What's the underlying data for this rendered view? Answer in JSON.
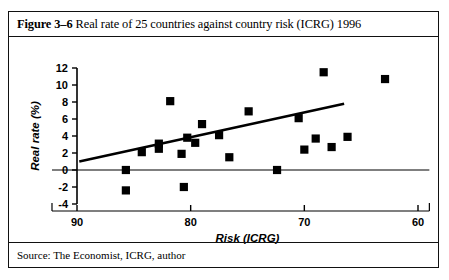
{
  "figure": {
    "label": "Figure 3–6",
    "title": "Real rate of 25 countries against country risk (ICRG) 1996",
    "source": "Source: The Economist, ICRG, author"
  },
  "chart_data": {
    "type": "scatter",
    "title": "Real rate of 25 countries against country risk (ICRG) 1996",
    "xlabel": "Risk (ICRG)",
    "ylabel": "Real rate (%)",
    "xlim": [
      92,
      59
    ],
    "ylim": [
      -4,
      12
    ],
    "x_reversed": true,
    "xticks": [
      90,
      80,
      70,
      60
    ],
    "yticks": [
      -4,
      -2,
      0,
      2,
      4,
      6,
      8,
      10,
      12
    ],
    "grid": false,
    "legend": "none",
    "marker": "filled-square",
    "marker_color": "#000000",
    "points": [
      {
        "x": 85.7,
        "y": 0.0
      },
      {
        "x": 85.7,
        "y": -2.4
      },
      {
        "x": 84.3,
        "y": 2.1
      },
      {
        "x": 82.8,
        "y": 3.1
      },
      {
        "x": 82.8,
        "y": 2.5
      },
      {
        "x": 81.8,
        "y": 8.1
      },
      {
        "x": 80.8,
        "y": 1.9
      },
      {
        "x": 80.6,
        "y": -2.0
      },
      {
        "x": 80.3,
        "y": 3.8
      },
      {
        "x": 79.6,
        "y": 3.2
      },
      {
        "x": 79.0,
        "y": 5.4
      },
      {
        "x": 77.5,
        "y": 4.1
      },
      {
        "x": 76.6,
        "y": 1.5
      },
      {
        "x": 74.9,
        "y": 6.9
      },
      {
        "x": 72.4,
        "y": 0.0
      },
      {
        "x": 70.5,
        "y": 6.1
      },
      {
        "x": 70.0,
        "y": 2.4
      },
      {
        "x": 69.0,
        "y": 3.7
      },
      {
        "x": 68.3,
        "y": 11.5
      },
      {
        "x": 67.6,
        "y": 2.7
      },
      {
        "x": 66.2,
        "y": 3.9
      },
      {
        "x": 62.9,
        "y": 10.7
      }
    ],
    "trendline": {
      "type": "linear",
      "x_start": 89.8,
      "y_start": 1.0,
      "x_end": 66.5,
      "y_end": 7.8
    }
  }
}
